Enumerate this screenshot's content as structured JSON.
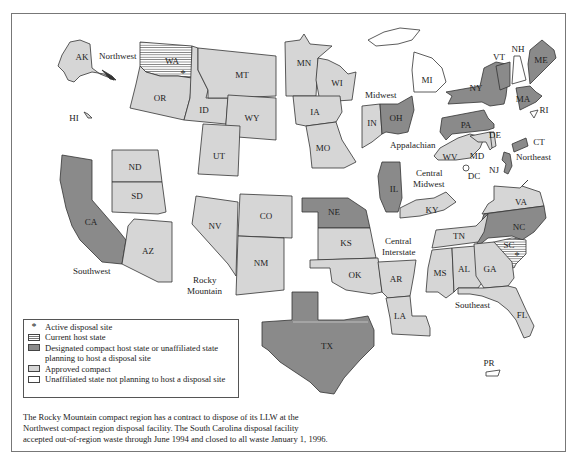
{
  "colors": {
    "approved_compact": "#d6d6d6",
    "designated_host": "#8a8a8a",
    "unaffiliated": "#ffffff",
    "current_host_stripe": "#777777",
    "border": "#333333"
  },
  "regions": {
    "northwest": "Northwest",
    "southwest": "Southwest",
    "rocky_mountain_1": "Rocky",
    "rocky_mountain_2": "Mountain",
    "midwest": "Midwest",
    "appalachian": "Appalachian",
    "central_midwest_1": "Central",
    "central_midwest_2": "Midwest",
    "central_interstate_1": "Central",
    "central_interstate_2": "Interstate",
    "southeast": "Southeast",
    "northeast": "Northeast"
  },
  "states": {
    "AK": "AK",
    "HI": "HI",
    "WA": "WA",
    "OR": "OR",
    "ID": "ID",
    "MT": "MT",
    "WY": "WY",
    "UT": "UT",
    "ND": "ND",
    "SD": "SD",
    "CA": "CA",
    "AZ": "AZ",
    "NV": "NV",
    "CO": "CO",
    "NM": "NM",
    "MN": "MN",
    "WI": "WI",
    "IA": "IA",
    "MO": "MO",
    "MI": "MI",
    "IN": "IN",
    "OH": "OH",
    "NY": "NY",
    "VT": "VT",
    "NH": "NH",
    "ME": "ME",
    "MA": "MA",
    "RI": "RI",
    "CT": "CT",
    "PA": "PA",
    "DE": "DE",
    "MD": "MD",
    "WV": "WV",
    "NJ": "NJ",
    "DC": "DC",
    "IL": "IL",
    "KY": "KY",
    "NE": "NE",
    "KS": "KS",
    "OK": "OK",
    "AR": "AR",
    "LA": "LA",
    "TX": "TX",
    "VA": "VA",
    "NC": "NC",
    "SC": "SC",
    "TN": "TN",
    "MS": "MS",
    "AL": "AL",
    "GA": "GA",
    "FL": "FL",
    "PR": "PR"
  },
  "state_status": {
    "current_host": [
      "WA",
      "SC"
    ],
    "active_disposal_site": [
      "WA",
      "SC"
    ],
    "designated_host": [
      "CA",
      "TX",
      "NE",
      "IL",
      "OH",
      "NY",
      "PA",
      "NC",
      "ME",
      "VT",
      "MA",
      "CT",
      "NJ"
    ],
    "approved_compact": [
      "AK",
      "HI",
      "OR",
      "ID",
      "MT",
      "WY",
      "UT",
      "ND",
      "SD",
      "AZ",
      "NV",
      "CO",
      "NM",
      "MN",
      "WI",
      "IA",
      "MO",
      "IN",
      "WV",
      "MD",
      "DE",
      "KY",
      "KS",
      "OK",
      "AR",
      "LA",
      "VA",
      "TN",
      "MS",
      "AL",
      "GA",
      "FL"
    ],
    "unaffiliated": [
      "MI",
      "NH",
      "RI",
      "DC",
      "PR"
    ]
  },
  "legend": {
    "active_site_symbol": "*",
    "active_site": "Active disposal site",
    "current_host": "Current host state",
    "designated_line1": "Designated compact host state or unaffiliated state",
    "designated_line2": "planning to host a disposal site",
    "approved": "Approved compact",
    "unaffiliated": "Unaffiliated state not planning to host a disposal site"
  },
  "note": {
    "line1": "The Rocky Mountain compact region has a contract to dispose of its LLW at the",
    "line2": "Northwest compact region disposal facility. The South Carolina disposal facility",
    "line3": "accepted out-of-region waste through June 1994 and closed to all waste January 1, 1996."
  }
}
